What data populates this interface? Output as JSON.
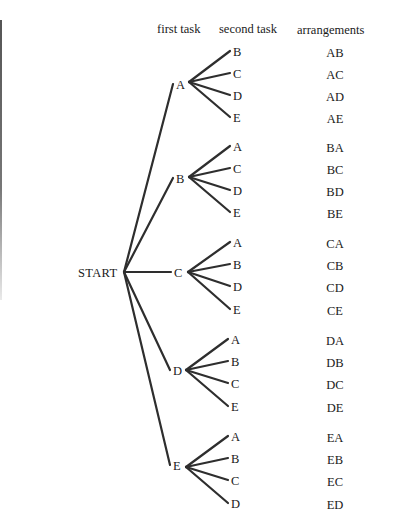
{
  "headers": {
    "first_task": "first task",
    "second_task": "second task",
    "arrangements": "arrangements"
  },
  "root": {
    "label": "START",
    "x": 124,
    "y": 272
  },
  "branches": [
    {
      "label": "A",
      "end": [
        173,
        84
      ],
      "hub": [
        189,
        82
      ],
      "children": [
        {
          "label": "B",
          "y": 51,
          "arrangement": "AB"
        },
        {
          "label": "C",
          "y": 73,
          "arrangement": "AC"
        },
        {
          "label": "D",
          "y": 95,
          "arrangement": "AD"
        },
        {
          "label": "E",
          "y": 117,
          "arrangement": "AE"
        }
      ]
    },
    {
      "label": "B",
      "end": [
        173,
        178
      ],
      "hub": [
        189,
        177
      ],
      "children": [
        {
          "label": "A",
          "y": 146,
          "arrangement": "BA"
        },
        {
          "label": "C",
          "y": 168,
          "arrangement": "BC"
        },
        {
          "label": "D",
          "y": 190,
          "arrangement": "BD"
        },
        {
          "label": "E",
          "y": 212,
          "arrangement": "BE"
        }
      ]
    },
    {
      "label": "C",
      "end": [
        171,
        272
      ],
      "hub": [
        188,
        272
      ],
      "children": [
        {
          "label": "A",
          "y": 242,
          "arrangement": "CA"
        },
        {
          "label": "B",
          "y": 264,
          "arrangement": "CB"
        },
        {
          "label": "D",
          "y": 286,
          "arrangement": "CD"
        },
        {
          "label": "E",
          "y": 309,
          "arrangement": "CE"
        }
      ]
    },
    {
      "label": "D",
      "end": [
        170,
        370
      ],
      "hub": [
        186,
        370
      ],
      "children": [
        {
          "label": "A",
          "y": 339,
          "arrangement": "DA"
        },
        {
          "label": "B",
          "y": 361,
          "arrangement": "DB"
        },
        {
          "label": "C",
          "y": 383,
          "arrangement": "DC"
        },
        {
          "label": "E",
          "y": 406,
          "arrangement": "DE"
        }
      ]
    },
    {
      "label": "E",
      "end": [
        170,
        465
      ],
      "hub": [
        186,
        467
      ],
      "children": [
        {
          "label": "A",
          "y": 436,
          "arrangement": "EA"
        },
        {
          "label": "B",
          "y": 458,
          "arrangement": "EB"
        },
        {
          "label": "C",
          "y": 480,
          "arrangement": "EC"
        },
        {
          "label": "D",
          "y": 503,
          "arrangement": "ED"
        }
      ]
    }
  ],
  "colors": {
    "line": "#2e2e2e",
    "text": "#1a1a1a",
    "background": "#ffffff"
  }
}
